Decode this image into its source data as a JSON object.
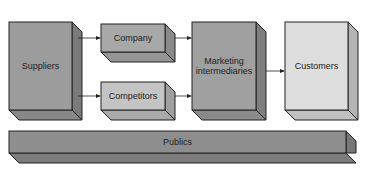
{
  "diagram": {
    "nodes": [
      {
        "id": "suppliers",
        "label": "Suppliers",
        "fill": "#9c9c9c"
      },
      {
        "id": "company",
        "label": "Company",
        "fill": "#a8a8a8"
      },
      {
        "id": "competitors",
        "label": "Competitors",
        "fill": "#c4c4c4"
      },
      {
        "id": "marketing_intermediaries",
        "label": "Marketing intermediaries",
        "line1": "Marketing",
        "line2": "intermediaries",
        "fill": "#a0a0a0"
      },
      {
        "id": "customers",
        "label": "Customers",
        "fill": "#dedede"
      },
      {
        "id": "publics",
        "label": "Publics",
        "fill": "#8e8e8e"
      }
    ],
    "edges": [
      {
        "from": "suppliers",
        "to": "company"
      },
      {
        "from": "suppliers",
        "to": "competitors"
      },
      {
        "from": "company",
        "to": "marketing_intermediaries"
      },
      {
        "from": "competitors",
        "to": "marketing_intermediaries"
      },
      {
        "from": "marketing_intermediaries",
        "to": "customers"
      }
    ]
  }
}
